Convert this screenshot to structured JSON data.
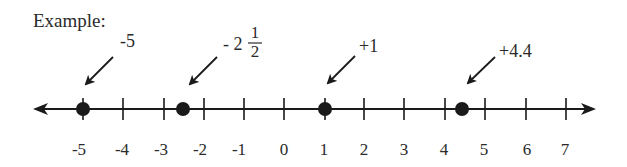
{
  "title": "Example:",
  "number_line": {
    "min_tick": -5,
    "max_tick": 7,
    "ticks": [
      {
        "value": -5,
        "label": "-5"
      },
      {
        "value": -4,
        "label": "-4"
      },
      {
        "value": -3,
        "label": "-3"
      },
      {
        "value": -2,
        "label": "-2"
      },
      {
        "value": -1,
        "label": "-1"
      },
      {
        "value": 0,
        "label": "0"
      },
      {
        "value": 1,
        "label": "1"
      },
      {
        "value": 2,
        "label": "2"
      },
      {
        "value": 3,
        "label": "3"
      },
      {
        "value": 4,
        "label": "4"
      },
      {
        "value": 5,
        "label": "5"
      },
      {
        "value": 6,
        "label": "6"
      },
      {
        "value": 7,
        "label": "7"
      }
    ],
    "points": [
      {
        "value": -5,
        "label": "-5"
      },
      {
        "value": -2.5,
        "label_whole": "- 2",
        "label_num": "1",
        "label_den": "2"
      },
      {
        "value": 1,
        "label": "+1"
      },
      {
        "value": 4.4,
        "label": "+4.4"
      }
    ],
    "colors": {
      "line": "#1a1a1a",
      "point": "#1a1a1a",
      "text": "#2a2a2a"
    }
  }
}
